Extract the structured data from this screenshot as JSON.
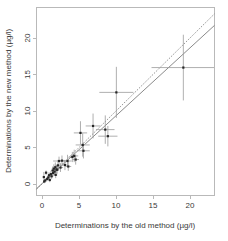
{
  "chart_data": {
    "type": "scatter",
    "title": "",
    "xlabel": "Determinations by the old method (µg/l)",
    "ylabel": "Determinations by the new method (µg/l)",
    "xlim": [
      -1.0,
      23.5
    ],
    "ylim": [
      -1.0,
      22.5
    ],
    "xticks": [
      0,
      5,
      10,
      15,
      20
    ],
    "yticks": [
      0,
      5,
      10,
      15,
      20
    ],
    "xtick_labels": [
      "0",
      "5",
      "10",
      "15",
      "20"
    ],
    "ytick_labels": [
      "0",
      "5",
      "10",
      "15",
      "20"
    ],
    "grid": false,
    "legend": "none",
    "point_marker": "filled-square",
    "error_bars": "both-axes-no-caps",
    "series": [
      {
        "name": "Paired method determinations",
        "points": [
          {
            "x": 0.25,
            "y": 0.95,
            "xerr": 0.12,
            "yerr": 0.7
          },
          {
            "x": 0.3,
            "y": 0.35,
            "xerr": 0.1,
            "yerr": 0.25
          },
          {
            "x": 0.45,
            "y": 0.5,
            "xerr": 0.12,
            "yerr": 0.28
          },
          {
            "x": 0.55,
            "y": 1.55,
            "xerr": 0.15,
            "yerr": 0.3
          },
          {
            "x": 0.7,
            "y": 0.7,
            "xerr": 0.15,
            "yerr": 0.3
          },
          {
            "x": 0.85,
            "y": 0.9,
            "xerr": 0.18,
            "yerr": 0.35
          },
          {
            "x": 0.95,
            "y": 1.2,
            "xerr": 0.18,
            "yerr": 0.4
          },
          {
            "x": 1.05,
            "y": 0.55,
            "xerr": 0.15,
            "yerr": 0.3
          },
          {
            "x": 1.2,
            "y": 1.35,
            "xerr": 0.2,
            "yerr": 0.45
          },
          {
            "x": 1.3,
            "y": 1.05,
            "xerr": 0.2,
            "yerr": 0.4
          },
          {
            "x": 1.45,
            "y": 1.85,
            "xerr": 0.25,
            "yerr": 0.55
          },
          {
            "x": 1.5,
            "y": 1.5,
            "xerr": 0.22,
            "yerr": 0.45
          },
          {
            "x": 1.6,
            "y": 2.1,
            "xerr": 0.28,
            "yerr": 0.6
          },
          {
            "x": 1.7,
            "y": 1.7,
            "xerr": 0.25,
            "yerr": 0.5
          },
          {
            "x": 1.8,
            "y": 2.3,
            "xerr": 0.3,
            "yerr": 0.65
          },
          {
            "x": 1.85,
            "y": 1.25,
            "xerr": 0.22,
            "yerr": 0.45
          },
          {
            "x": 1.95,
            "y": 2.0,
            "xerr": 0.28,
            "yerr": 0.55
          },
          {
            "x": 2.05,
            "y": 1.95,
            "xerr": 0.3,
            "yerr": 0.55
          },
          {
            "x": 2.15,
            "y": 2.55,
            "xerr": 0.35,
            "yerr": 0.75
          },
          {
            "x": 2.3,
            "y": 3.15,
            "xerr": 0.8,
            "yerr": 0.6
          },
          {
            "x": 2.5,
            "y": 2.25,
            "xerr": 0.35,
            "yerr": 0.6
          },
          {
            "x": 2.7,
            "y": 3.2,
            "xerr": 0.45,
            "yerr": 0.7
          },
          {
            "x": 3.1,
            "y": 2.6,
            "xerr": 0.4,
            "yerr": 0.7
          },
          {
            "x": 3.45,
            "y": 3.15,
            "xerr": 0.55,
            "yerr": 0.85
          },
          {
            "x": 3.55,
            "y": 2.4,
            "xerr": 0.4,
            "yerr": 0.6
          },
          {
            "x": 4.1,
            "y": 3.7,
            "xerr": 0.5,
            "yerr": 0.7
          },
          {
            "x": 4.35,
            "y": 3.85,
            "xerr": 0.55,
            "yerr": 0.85
          },
          {
            "x": 4.55,
            "y": 3.35,
            "xerr": 0.45,
            "yerr": 0.7
          },
          {
            "x": 5.2,
            "y": 7.0,
            "xerr": 0.9,
            "yerr": 1.6
          },
          {
            "x": 5.5,
            "y": 5.35,
            "xerr": 0.95,
            "yerr": 1.6
          },
          {
            "x": 5.6,
            "y": 4.55,
            "xerr": 0.85,
            "yerr": 1.05
          },
          {
            "x": 6.9,
            "y": 7.95,
            "xerr": 1.0,
            "yerr": 1.7
          },
          {
            "x": 8.55,
            "y": 7.45,
            "xerr": 1.25,
            "yerr": 1.95
          },
          {
            "x": 8.9,
            "y": 6.55,
            "xerr": 1.3,
            "yerr": 1.4
          },
          {
            "x": 10.05,
            "y": 12.55,
            "xerr": 2.3,
            "yerr": 3.5
          },
          {
            "x": 19.1,
            "y": 15.95,
            "xerr": 4.3,
            "yerr": 4.5
          }
        ]
      }
    ],
    "lines": [
      {
        "name": "identity-line",
        "style": "dashed",
        "slope": 1.0,
        "intercept": 0.0
      },
      {
        "name": "fitted-regression-line",
        "style": "solid",
        "slope": 0.93,
        "intercept": 0.05
      }
    ]
  }
}
